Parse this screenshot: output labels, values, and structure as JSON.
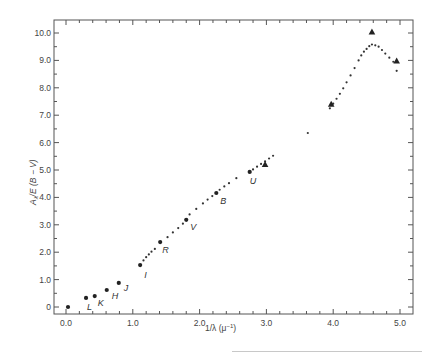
{
  "chart_data": {
    "type": "scatter",
    "title": "",
    "xlabel": "1/λ (μ⁻¹)",
    "ylabel": "A_λ / E(B − V)",
    "xlim": [
      -0.18,
      5.2
    ],
    "ylim": [
      -0.25,
      10.5
    ],
    "grid": false,
    "legend": null,
    "x_ticks": [
      0.0,
      1.0,
      2.0,
      3.0,
      4.0,
      5.0
    ],
    "x_tick_labels": [
      "0.0",
      "1.0",
      "2.0",
      "3.0",
      "4.0",
      "5.0"
    ],
    "y_ticks": [
      0,
      1.0,
      2.0,
      3.0,
      4.0,
      5.0,
      6.0,
      7.0,
      8.0,
      9.0,
      10.0
    ],
    "y_tick_labels": [
      "0",
      "1.0",
      "2.0",
      "3.0",
      "4.0",
      "5.0",
      "6.0",
      "7.0",
      "8.0",
      "9.0",
      "10.0"
    ],
    "series": [
      {
        "name": "photometric bands",
        "marker": "large-dot",
        "points": [
          {
            "x": 0.03,
            "y": 0.0,
            "label": ""
          },
          {
            "x": 0.3,
            "y": 0.33,
            "label": "L"
          },
          {
            "x": 0.43,
            "y": 0.4,
            "label": "K"
          },
          {
            "x": 0.61,
            "y": 0.62,
            "label": "H"
          },
          {
            "x": 0.79,
            "y": 0.88,
            "label": "J"
          },
          {
            "x": 1.11,
            "y": 1.53,
            "label": "I"
          },
          {
            "x": 1.41,
            "y": 2.37,
            "label": "R"
          },
          {
            "x": 1.8,
            "y": 3.18,
            "label": "V"
          },
          {
            "x": 2.25,
            "y": 4.16,
            "label": "B"
          },
          {
            "x": 2.75,
            "y": 4.93,
            "label": "U"
          }
        ]
      },
      {
        "name": "spectrophotometric",
        "marker": "small-dot",
        "points": [
          {
            "x": 1.16,
            "y": 1.7
          },
          {
            "x": 1.2,
            "y": 1.82
          },
          {
            "x": 1.24,
            "y": 1.92
          },
          {
            "x": 1.28,
            "y": 2.02
          },
          {
            "x": 1.33,
            "y": 2.12
          },
          {
            "x": 1.52,
            "y": 2.55
          },
          {
            "x": 1.6,
            "y": 2.72
          },
          {
            "x": 1.68,
            "y": 2.88
          },
          {
            "x": 1.75,
            "y": 3.04
          },
          {
            "x": 1.85,
            "y": 3.38
          },
          {
            "x": 1.95,
            "y": 3.58
          },
          {
            "x": 2.05,
            "y": 3.78
          },
          {
            "x": 2.12,
            "y": 3.92
          },
          {
            "x": 2.19,
            "y": 4.05
          },
          {
            "x": 2.3,
            "y": 4.28
          },
          {
            "x": 2.37,
            "y": 4.4
          },
          {
            "x": 2.44,
            "y": 4.52
          },
          {
            "x": 2.55,
            "y": 4.7
          },
          {
            "x": 2.8,
            "y": 5.02
          },
          {
            "x": 2.86,
            "y": 5.12
          },
          {
            "x": 2.92,
            "y": 5.22
          },
          {
            "x": 2.98,
            "y": 5.32
          },
          {
            "x": 3.04,
            "y": 5.42
          },
          {
            "x": 3.1,
            "y": 5.52
          },
          {
            "x": 3.62,
            "y": 6.35
          },
          {
            "x": 3.95,
            "y": 7.25
          },
          {
            "x": 4.0,
            "y": 7.42
          },
          {
            "x": 4.05,
            "y": 7.6
          },
          {
            "x": 4.1,
            "y": 7.78
          },
          {
            "x": 4.15,
            "y": 7.98
          },
          {
            "x": 4.2,
            "y": 8.2
          },
          {
            "x": 4.26,
            "y": 8.45
          },
          {
            "x": 4.32,
            "y": 8.72
          },
          {
            "x": 4.38,
            "y": 9.0
          },
          {
            "x": 4.42,
            "y": 9.18
          },
          {
            "x": 4.46,
            "y": 9.32
          },
          {
            "x": 4.5,
            "y": 9.42
          },
          {
            "x": 4.54,
            "y": 9.52
          },
          {
            "x": 4.58,
            "y": 9.58
          },
          {
            "x": 4.63,
            "y": 9.55
          },
          {
            "x": 4.68,
            "y": 9.5
          },
          {
            "x": 4.73,
            "y": 9.38
          },
          {
            "x": 4.78,
            "y": 9.25
          },
          {
            "x": 4.84,
            "y": 9.1
          },
          {
            "x": 4.9,
            "y": 8.95
          },
          {
            "x": 4.95,
            "y": 8.62
          }
        ]
      },
      {
        "name": "satellite UV",
        "marker": "triangle",
        "points": [
          {
            "x": 2.98,
            "y": 5.2
          },
          {
            "x": 3.97,
            "y": 7.4
          },
          {
            "x": 4.58,
            "y": 10.04
          },
          {
            "x": 4.95,
            "y": 8.98
          }
        ]
      }
    ]
  },
  "axes": {
    "x_title_main": "1/λ (μ",
    "x_title_sup": "−1",
    "x_title_end": ")",
    "y_title_main": "A",
    "y_title_sub": "λ",
    "y_title_rest": "/E (B − V)"
  }
}
